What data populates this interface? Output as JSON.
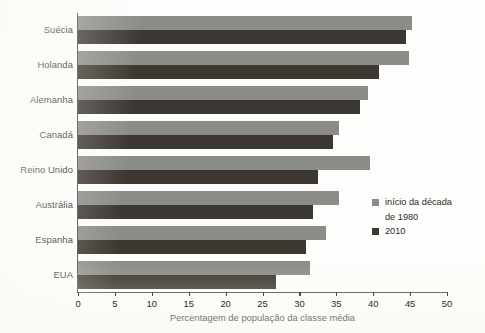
{
  "chart_data": {
    "type": "bar",
    "orientation": "horizontal",
    "title": "",
    "xlabel": "Percentagem de população da classe média",
    "ylabel": "",
    "xlim": [
      0,
      50
    ],
    "xticks": [
      0,
      5,
      10,
      15,
      20,
      25,
      30,
      35,
      40,
      45,
      50
    ],
    "grid": false,
    "legend_position": "right-middle",
    "categories": [
      "Suécia",
      "Holanda",
      "Alemanha",
      "Canadá",
      "Reino Unido",
      "Austrália",
      "Espanha",
      "EUA"
    ],
    "series": [
      {
        "name": "início da década de 1980",
        "color": "#8b8b87",
        "values": [
          45.2,
          44.9,
          39.3,
          35.3,
          39.5,
          35.3,
          33.6,
          31.5
        ]
      },
      {
        "name": "2010",
        "color": "#3d3731",
        "values": [
          44.5,
          40.8,
          38.2,
          34.6,
          32.5,
          31.8,
          30.9,
          26.8
        ]
      }
    ]
  },
  "legend": {
    "entries": [
      {
        "label_line1": "início da década",
        "label_line2": "de 1980",
        "color": "#8b8b87"
      },
      {
        "label_line1": "2010",
        "label_line2": "",
        "color": "#3d3731"
      }
    ]
  },
  "axis": {
    "x_title": "Percentagem de população da classe média",
    "tick_labels": [
      "0",
      "5",
      "10",
      "15",
      "20",
      "25",
      "30",
      "35",
      "40",
      "45",
      "50"
    ]
  }
}
